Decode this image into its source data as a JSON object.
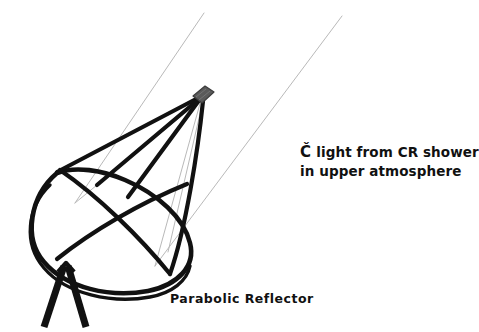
{
  "figure": {
    "background_color": "#ffffff",
    "ink_color": "#111111",
    "focus_box_color": "#5a5a5a",
    "ray_color": "#b9b9b9"
  },
  "labels": {
    "cherenkov": {
      "symbol": "Č",
      "line1_rest": " light from CR shower",
      "line2": "in upper atmosphere",
      "full_text": "Č light from CR shower in upper atmosphere"
    },
    "reflector": {
      "text": "Parabolic Reflector"
    }
  },
  "parts": {
    "dish": "parabolic-dish",
    "camera": "focal-plane-camera-box",
    "mount": "tripod-mount",
    "support_arms": "camera-support-arms",
    "incoming_rays": "incoming-cherenkov-light-rays",
    "reflected_rays": "reflected-light-rays"
  }
}
